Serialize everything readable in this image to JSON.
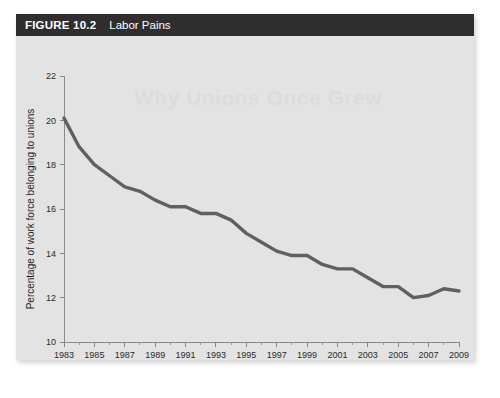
{
  "figure": {
    "number_label": "FIGURE 10.2",
    "title": "Labor Pains",
    "ghost_text": "Why Unions Once Grew"
  },
  "chart_data": {
    "type": "line",
    "title": "Labor Pains",
    "xlabel": "Year",
    "ylabel": "Percentage of work force belonging to unions",
    "xlim": [
      1983,
      2009
    ],
    "ylim": [
      10,
      22
    ],
    "grid": false,
    "legend": null,
    "x_tick_labels": [
      "1983",
      "1985",
      "1987",
      "1989",
      "1991",
      "1993",
      "1995",
      "1997",
      "1999",
      "2001",
      "2003",
      "2005",
      "2007",
      "2009"
    ],
    "x_tick_values": [
      1983,
      1985,
      1987,
      1989,
      1991,
      1993,
      1995,
      1997,
      1999,
      2001,
      2003,
      2005,
      2007,
      2009
    ],
    "x_minor_tick_values": [
      1984,
      1986,
      1988,
      1990,
      1992,
      1994,
      1996,
      1998,
      2000,
      2002,
      2004,
      2006,
      2008
    ],
    "y_tick_labels": [
      "10",
      "12",
      "14",
      "16",
      "18",
      "20",
      "22"
    ],
    "y_tick_values": [
      10,
      12,
      14,
      16,
      18,
      20,
      22
    ],
    "series": [
      {
        "name": "Percentage of work force belonging to unions",
        "color": "#606060",
        "x": [
          1983,
          1984,
          1985,
          1986,
          1987,
          1988,
          1989,
          1990,
          1991,
          1992,
          1993,
          1994,
          1995,
          1996,
          1997,
          1998,
          1999,
          2000,
          2001,
          2002,
          2003,
          2004,
          2005,
          2006,
          2007,
          2008,
          2009
        ],
        "values": [
          20.1,
          18.8,
          18.0,
          17.5,
          17.0,
          16.8,
          16.4,
          16.1,
          16.1,
          15.8,
          15.8,
          15.5,
          14.9,
          14.5,
          14.1,
          13.9,
          13.9,
          13.5,
          13.3,
          13.3,
          12.9,
          12.5,
          12.5,
          12.0,
          12.1,
          12.4,
          12.3
        ]
      }
    ]
  }
}
